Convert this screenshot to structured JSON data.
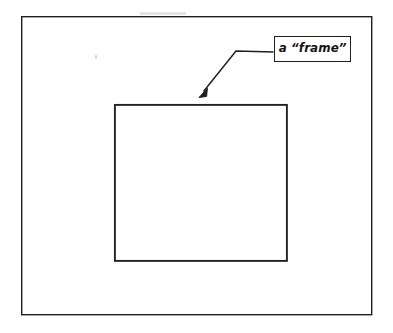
{
  "diagram": {
    "background_color": "#ffffff",
    "stroke_color": "#1f1f1f",
    "outer_rectangle": {
      "name": "outer boundary rectangle",
      "x": 21,
      "y": 16,
      "width": 351,
      "height": 299,
      "stroke_width": 1.4,
      "fill": "none"
    },
    "inner_rectangle": {
      "name": "inner frame rectangle",
      "x": 114,
      "y": 104,
      "width": 173,
      "height": 157,
      "stroke_width": 1.9,
      "fill": "none"
    },
    "callout": {
      "label": "a “frame”",
      "box": {
        "x": 274,
        "y": 36,
        "width": 77,
        "height": 26,
        "stroke_width": 1.6
      },
      "leader": {
        "horizontal_start_x": 274,
        "horizontal_start_y": 52,
        "bend_x": 236,
        "bend_y": 51,
        "arrow_tip_x": 199,
        "arrow_tip_y": 97,
        "stroke_width": 1.4,
        "arrowhead": "filled-triangle"
      },
      "points_to": "inner_rectangle"
    }
  }
}
